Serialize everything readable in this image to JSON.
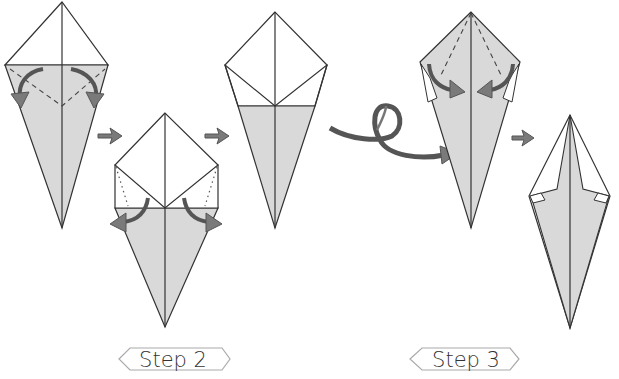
{
  "colors": {
    "paper_white": "#ffffff",
    "paper_gray": "#d9d9d9",
    "line": "#333333",
    "arrow_fill": "#7a7a7a",
    "arrow_stroke": "#555555",
    "label_border": "#aaaaaa"
  },
  "labels": {
    "step2": "Step 2",
    "step3": "Step 3"
  },
  "figures": [
    {
      "id": "fig-1",
      "description": "Kite base with valley-fold dashed lines and two curved fold arrows"
    },
    {
      "id": "fig-2",
      "description": "Folded-down top with dotted crease lines and two unfold arrows"
    },
    {
      "id": "fig-3",
      "description": "Kite with white upper flap and gray lower half"
    },
    {
      "id": "fig-4",
      "description": "Turned-over gray kite with dashed lines and two inward fold arrows"
    },
    {
      "id": "fig-5",
      "description": "Narrow finished diamond shape"
    }
  ],
  "arrows": [
    {
      "id": "arrow-next-1",
      "type": "step-arrow"
    },
    {
      "id": "arrow-next-2",
      "type": "step-arrow"
    },
    {
      "id": "arrow-turn-over",
      "type": "loop-arrow"
    },
    {
      "id": "arrow-next-3",
      "type": "step-arrow"
    }
  ]
}
